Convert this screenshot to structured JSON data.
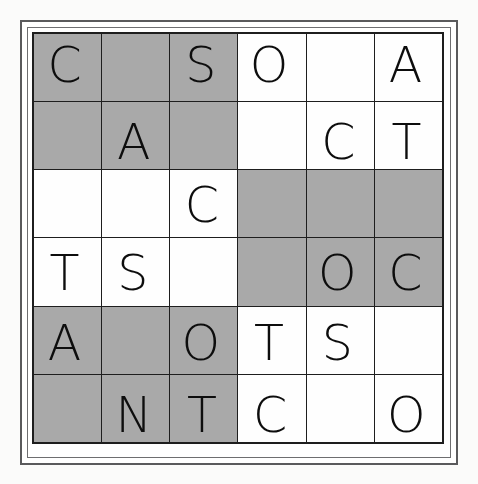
{
  "puzzle": {
    "title": "Letter grid puzzle",
    "rows": 6,
    "columns": 6,
    "colors": {
      "shaded_cell": "#a9a9a9",
      "plain_cell": "#fefefe",
      "grid_line": "#1e1e1e",
      "letter": "#0d0d0d",
      "frame": "#5a5a5c",
      "page_background": "#fbfbfa"
    },
    "alphabet_used": [
      "A",
      "C",
      "N",
      "O",
      "S",
      "T"
    ],
    "grid": [
      [
        {
          "letter": "C",
          "shaded": true
        },
        {
          "letter": "",
          "shaded": true
        },
        {
          "letter": "S",
          "shaded": true
        },
        {
          "letter": "O",
          "shaded": false
        },
        {
          "letter": "",
          "shaded": false
        },
        {
          "letter": "A",
          "shaded": false
        }
      ],
      [
        {
          "letter": "",
          "shaded": true
        },
        {
          "letter": "A",
          "shaded": true
        },
        {
          "letter": "",
          "shaded": true
        },
        {
          "letter": "",
          "shaded": false
        },
        {
          "letter": "C",
          "shaded": false
        },
        {
          "letter": "T",
          "shaded": false
        }
      ],
      [
        {
          "letter": "",
          "shaded": false
        },
        {
          "letter": "",
          "shaded": false
        },
        {
          "letter": "C",
          "shaded": false
        },
        {
          "letter": "",
          "shaded": true
        },
        {
          "letter": "",
          "shaded": true
        },
        {
          "letter": "",
          "shaded": true
        }
      ],
      [
        {
          "letter": "T",
          "shaded": false
        },
        {
          "letter": "S",
          "shaded": false
        },
        {
          "letter": "",
          "shaded": false
        },
        {
          "letter": "",
          "shaded": true
        },
        {
          "letter": "O",
          "shaded": true
        },
        {
          "letter": "C",
          "shaded": true
        }
      ],
      [
        {
          "letter": "A",
          "shaded": true
        },
        {
          "letter": "",
          "shaded": true
        },
        {
          "letter": "O",
          "shaded": true
        },
        {
          "letter": "T",
          "shaded": false
        },
        {
          "letter": "S",
          "shaded": false
        },
        {
          "letter": "",
          "shaded": false
        }
      ],
      [
        {
          "letter": "",
          "shaded": true
        },
        {
          "letter": "N",
          "shaded": true
        },
        {
          "letter": "T",
          "shaded": true
        },
        {
          "letter": "C",
          "shaded": false
        },
        {
          "letter": "",
          "shaded": false
        },
        {
          "letter": "O",
          "shaded": false
        }
      ]
    ]
  }
}
